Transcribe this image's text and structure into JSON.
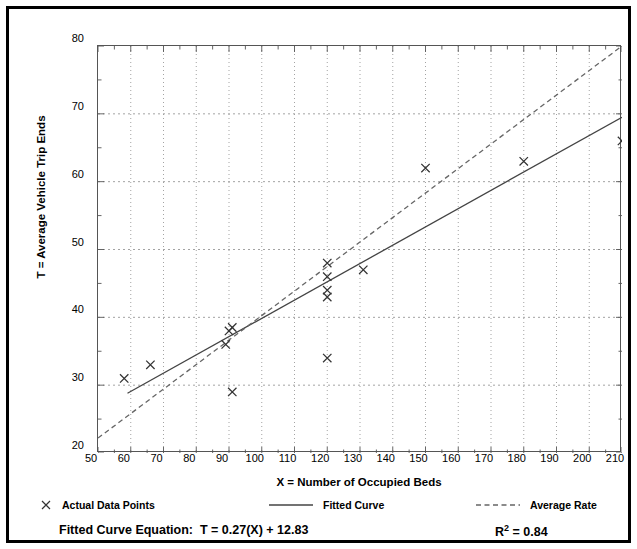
{
  "figure": {
    "top_fragment_text": "Plot",
    "y_axis_title": "T = Average Vehicle Trip Ends",
    "x_axis_title": "X = Number of Occupied Beds"
  },
  "legend": {
    "items": [
      {
        "label": "Actual Data Points",
        "icon": "x-marker-icon",
        "style": "marker"
      },
      {
        "label": "Fitted Curve",
        "icon": "solid-line-icon",
        "style": "solid"
      },
      {
        "label": "Average Rate",
        "icon": "dashed-line-icon",
        "style": "dashed"
      }
    ]
  },
  "footer": {
    "equation_label": "Fitted Curve Equation:",
    "equation_value": "T = 0.27(X) + 12.83",
    "rsq_label": "R",
    "rsq_exponent": "2",
    "rsq_value": "= 0.84"
  },
  "colors": {
    "frame": "#000000",
    "axis": "#555555",
    "grid": "#999999",
    "marker": "#333333",
    "fitted_curve": "#444444",
    "average_rate": "#666666",
    "background": "#ffffff"
  },
  "chart_data": {
    "type": "scatter",
    "title": "",
    "xlabel": "X = Number of Occupied Beds",
    "ylabel": "T = Average Vehicle Trip Ends",
    "xlim": [
      50,
      210
    ],
    "ylim": [
      20,
      80
    ],
    "xticks": [
      50,
      60,
      70,
      80,
      90,
      100,
      110,
      120,
      130,
      140,
      150,
      160,
      170,
      180,
      190,
      200,
      210
    ],
    "yticks": [
      20,
      30,
      40,
      50,
      60,
      70,
      80
    ],
    "x_minor_tick_step": 5,
    "y_minor_tick_step": 5,
    "grid": true,
    "grid_style": "dotted",
    "legend_position": "below-plot",
    "series": [
      {
        "name": "Actual Data Points",
        "type": "scatter",
        "marker": "x",
        "points": [
          {
            "x": 58,
            "y": 31
          },
          {
            "x": 66,
            "y": 33
          },
          {
            "x": 89,
            "y": 36
          },
          {
            "x": 90,
            "y": 38
          },
          {
            "x": 91,
            "y": 38.5
          },
          {
            "x": 91,
            "y": 29
          },
          {
            "x": 120,
            "y": 48
          },
          {
            "x": 120,
            "y": 46
          },
          {
            "x": 120,
            "y": 44
          },
          {
            "x": 120,
            "y": 43
          },
          {
            "x": 120,
            "y": 34
          },
          {
            "x": 131,
            "y": 47
          },
          {
            "x": 150,
            "y": 62
          },
          {
            "x": 180,
            "y": 63
          },
          {
            "x": 210,
            "y": 66
          }
        ]
      },
      {
        "name": "Fitted Curve",
        "type": "line",
        "style": "solid",
        "equation": "T = 0.27(X) + 12.83",
        "r_squared": 0.84,
        "endpoints": [
          {
            "x": 59,
            "y": 28.8
          },
          {
            "x": 210,
            "y": 69.5
          }
        ]
      },
      {
        "name": "Average Rate",
        "type": "line",
        "style": "dashed",
        "endpoints": [
          {
            "x": 50,
            "y": 22.2
          },
          {
            "x": 210,
            "y": 80
          }
        ]
      }
    ]
  }
}
